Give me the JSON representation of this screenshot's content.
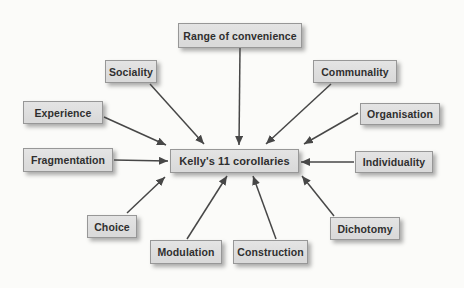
{
  "diagram": {
    "center": {
      "id": "kellys-11-corollaries",
      "label": "Kelly's 11 corollaries"
    },
    "nodes": [
      {
        "id": "range-of-convenience",
        "label": "Range of convenience"
      },
      {
        "id": "sociality",
        "label": "Sociality"
      },
      {
        "id": "communality",
        "label": "Communality"
      },
      {
        "id": "experience",
        "label": "Experience"
      },
      {
        "id": "organisation",
        "label": "Organisation"
      },
      {
        "id": "fragmentation",
        "label": "Fragmentation"
      },
      {
        "id": "individuality",
        "label": "Individuality"
      },
      {
        "id": "choice",
        "label": "Choice"
      },
      {
        "id": "modulation",
        "label": "Modulation"
      },
      {
        "id": "construction",
        "label": "Construction"
      },
      {
        "id": "dichotomy",
        "label": "Dichotomy"
      }
    ],
    "edges": [
      {
        "from": "range-of-convenience",
        "to": "kellys-11-corollaries"
      },
      {
        "from": "sociality",
        "to": "kellys-11-corollaries"
      },
      {
        "from": "communality",
        "to": "kellys-11-corollaries"
      },
      {
        "from": "experience",
        "to": "kellys-11-corollaries"
      },
      {
        "from": "organisation",
        "to": "kellys-11-corollaries"
      },
      {
        "from": "fragmentation",
        "to": "kellys-11-corollaries"
      },
      {
        "from": "individuality",
        "to": "kellys-11-corollaries"
      },
      {
        "from": "choice",
        "to": "kellys-11-corollaries"
      },
      {
        "from": "modulation",
        "to": "kellys-11-corollaries"
      },
      {
        "from": "construction",
        "to": "kellys-11-corollaries"
      },
      {
        "from": "dichotomy",
        "to": "kellys-11-corollaries"
      }
    ],
    "colors": {
      "background": "#fbfbf9",
      "box_fill": "#dadada",
      "box_border": "#979797",
      "box_text": "#2f2f2f",
      "arrow": "#474747",
      "shadow": "rgba(75,75,75,0.45)"
    }
  }
}
